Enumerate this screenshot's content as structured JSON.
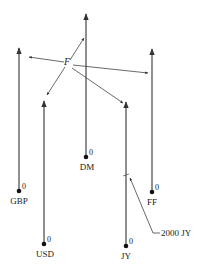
{
  "diagram": {
    "origin_label": "F",
    "axes": [
      {
        "id": "gbp",
        "label": "GBP",
        "zero": "0"
      },
      {
        "id": "usd",
        "label": "USD",
        "zero": "0"
      },
      {
        "id": "dm",
        "label": "DM",
        "zero": "0"
      },
      {
        "id": "jy",
        "label": "JY",
        "zero": "0"
      },
      {
        "id": "ff",
        "label": "FF",
        "zero": "0"
      }
    ],
    "annotation": {
      "label": "2000 JY",
      "target_axis": "JY"
    },
    "line_color": "#333333"
  }
}
